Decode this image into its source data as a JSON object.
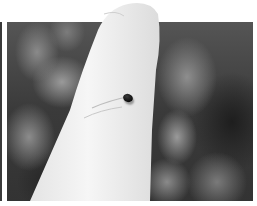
{
  "image": {
    "description": "Black-and-white photograph of a raised finger with a small dark beetle resting on it, against a blurred foliage background",
    "tone": "grayscale",
    "subjects": [
      {
        "name": "finger",
        "color": "#f2f2f2"
      },
      {
        "name": "beetle",
        "color": "#111111"
      }
    ],
    "background": {
      "name": "blurred-foliage",
      "color": "#3a3a3a"
    }
  }
}
